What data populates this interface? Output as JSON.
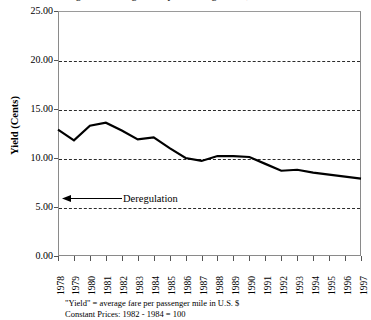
{
  "chart_data": {
    "type": "line",
    "title": "Figure 1: Average Yield per Passenger Mile, U.S. Airlines",
    "xlabel": "",
    "ylabel": "Yield (Cents)",
    "ylim": [
      0.0,
      25.0
    ],
    "ytick_values": [
      0.0,
      5.0,
      10.0,
      15.0,
      20.0,
      25.0
    ],
    "ytick_labels": [
      "0.00",
      "5.00",
      "10.00",
      "15.00",
      "20.00",
      "25.00"
    ],
    "grid": "horizontal-dashed",
    "legend": "none",
    "categories": [
      "1978",
      "1979",
      "1980",
      "1981",
      "1982",
      "1983",
      "1984",
      "1985",
      "1986",
      "1987",
      "1988",
      "1989",
      "1990",
      "1991",
      "1992",
      "1993",
      "1994",
      "1995",
      "1996",
      "1997"
    ],
    "values": [
      12.9,
      11.8,
      13.3,
      13.6,
      12.8,
      11.9,
      12.1,
      11.0,
      10.0,
      9.7,
      10.2,
      10.2,
      10.1,
      9.4,
      8.7,
      8.8,
      8.5,
      8.3,
      8.1,
      7.9
    ],
    "series": [
      {
        "name": "Yield (Cents)",
        "values": [
          12.9,
          11.8,
          13.3,
          13.6,
          12.8,
          11.9,
          12.1,
          11.0,
          10.0,
          9.7,
          10.2,
          10.2,
          10.1,
          9.4,
          8.7,
          8.8,
          8.5,
          8.3,
          8.1,
          7.9
        ]
      }
    ],
    "annotations": [
      {
        "text": "Deregulation",
        "value": 5.9,
        "arrow": "left",
        "x_position": "1978"
      }
    ],
    "footnotes": [
      "\"Yield\" = average fare per passenger mile in U.S. $",
      "Constant Prices: 1982 - 1984 = 100"
    ],
    "line_color": "#000000",
    "line_width": 2.2,
    "grid_color": "#2b2b2b",
    "axis_color": "#8a8a8a",
    "background_color": "#ffffff"
  }
}
